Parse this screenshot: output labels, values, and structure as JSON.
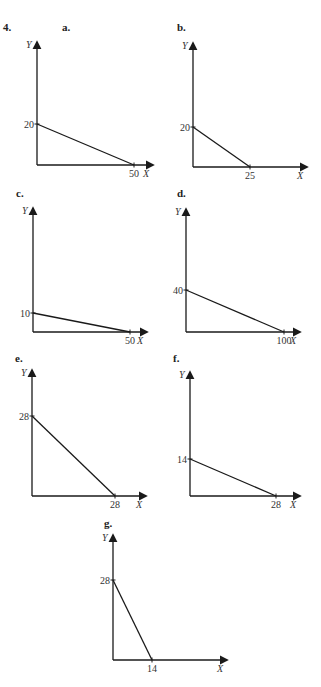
{
  "problem_number": "4.",
  "colors": {
    "line": "#1a1a1a",
    "text": "#333333",
    "background": "#ffffff"
  },
  "chart_data": [
    {
      "panel": "a.",
      "type": "line",
      "xlabel": "X",
      "ylabel": "Y",
      "y_intercept": 20,
      "x_intercept": 50,
      "x": [
        0,
        50
      ],
      "y": [
        20,
        0
      ],
      "y_tick_label": "20",
      "x_tick_label": "50",
      "layout": {
        "ox": 37,
        "oy": 165,
        "ytop": 42,
        "xright": 153,
        "ytick_py": 124,
        "xtick_px": 134,
        "label_x": 62,
        "label_y": 31
      }
    },
    {
      "panel": "b.",
      "type": "line",
      "xlabel": "X",
      "ylabel": "Y",
      "y_intercept": 20,
      "x_intercept": 25,
      "x": [
        0,
        25
      ],
      "y": [
        20,
        0
      ],
      "y_tick_label": "20",
      "x_tick_label": "25",
      "layout": {
        "ox": 193,
        "oy": 167,
        "ytop": 43,
        "xright": 307,
        "ytick_py": 127,
        "xtick_px": 250,
        "label_x": 177,
        "label_y": 31
      }
    },
    {
      "panel": "c.",
      "type": "line",
      "xlabel": "X",
      "ylabel": "Y",
      "y_intercept": 10,
      "x_intercept": 50,
      "x": [
        0,
        50
      ],
      "y": [
        10,
        0
      ],
      "y_tick_label": "10",
      "x_tick_label": "50",
      "layout": {
        "ox": 33,
        "oy": 332,
        "ytop": 208,
        "xright": 147,
        "ytick_py": 313,
        "xtick_px": 130,
        "label_x": 16,
        "label_y": 197
      }
    },
    {
      "panel": "d.",
      "type": "line",
      "xlabel": "X",
      "ylabel": "Y",
      "y_intercept": 40,
      "x_intercept": 100,
      "x": [
        0,
        100
      ],
      "y": [
        40,
        0
      ],
      "y_tick_label": "40",
      "x_tick_label": "100",
      "layout": {
        "ox": 186,
        "oy": 332,
        "ytop": 209,
        "xright": 300,
        "ytick_py": 290,
        "xtick_px": 284,
        "label_x": 177,
        "label_y": 197
      }
    },
    {
      "panel": "e.",
      "type": "line",
      "xlabel": "X",
      "ylabel": "Y",
      "y_intercept": 28,
      "x_intercept": 28,
      "x": [
        0,
        28
      ],
      "y": [
        28,
        0
      ],
      "y_tick_label": "28",
      "x_tick_label": "28",
      "layout": {
        "ox": 32,
        "oy": 496,
        "ytop": 370,
        "xright": 146,
        "ytick_py": 416,
        "xtick_px": 115,
        "label_x": 15,
        "label_y": 362
      }
    },
    {
      "panel": "f.",
      "type": "line",
      "xlabel": "X",
      "ylabel": "Y",
      "y_intercept": 14,
      "x_intercept": 28,
      "x": [
        0,
        28
      ],
      "y": [
        14,
        0
      ],
      "y_tick_label": "14",
      "x_tick_label": "28",
      "layout": {
        "ox": 190,
        "oy": 496,
        "ytop": 372,
        "xright": 300,
        "ytick_py": 459,
        "xtick_px": 276,
        "label_x": 173,
        "label_y": 362
      }
    },
    {
      "panel": "g.",
      "type": "line",
      "xlabel": "X",
      "ylabel": "Y",
      "y_intercept": 28,
      "x_intercept": 14,
      "x": [
        0,
        14
      ],
      "y": [
        28,
        0
      ],
      "y_tick_label": "28",
      "x_tick_label": "14",
      "layout": {
        "ox": 113,
        "oy": 660,
        "ytop": 535,
        "xright": 227,
        "ytick_py": 580,
        "xtick_px": 152,
        "label_x": 104,
        "label_y": 527
      }
    }
  ]
}
